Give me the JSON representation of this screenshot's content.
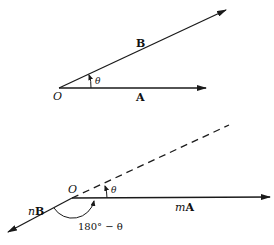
{
  "colors": {
    "ink": "#1a1a1a",
    "background": "#ffffff"
  },
  "top_figure": {
    "origin_label": "O",
    "vector_b_label": "B",
    "vector_a_label": "A",
    "angle_label": "θ"
  },
  "bottom_figure": {
    "origin_label": "O",
    "vector_ma_prefix": "m",
    "vector_ma_label": "A",
    "vector_nb_prefix": "n",
    "vector_nb_label": "B",
    "angle_label": "θ",
    "supplementary_angle_label": "180° − θ"
  }
}
